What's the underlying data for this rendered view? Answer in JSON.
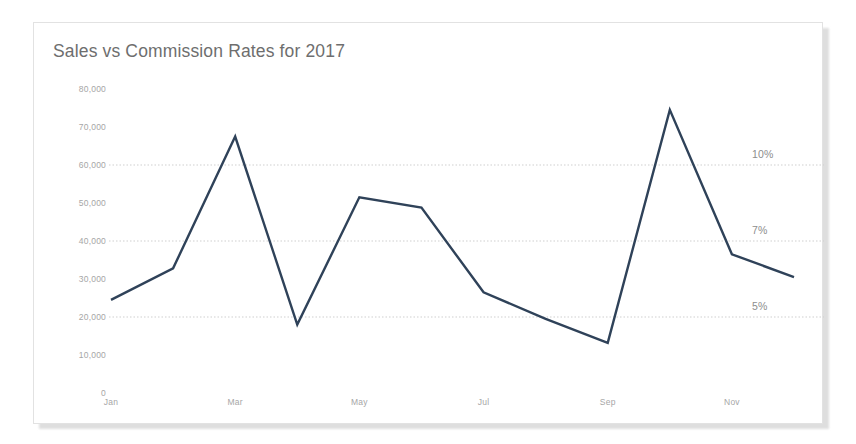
{
  "card": {
    "title": "Sales vs Commission Rates for 2017"
  },
  "colors": {
    "line": "#2f4259",
    "title_text": "#6e6e6e",
    "tick_text": "#a6a6a6",
    "pct_text": "#8d8d8d",
    "gridline": "#cfcfcf",
    "card_border": "#e2e2e2",
    "card_background": "#ffffff",
    "page_background": "#ffffff"
  },
  "chart_data": {
    "type": "line",
    "title": "Sales vs Commission Rates for 2017",
    "xlabel": "",
    "ylabel": "",
    "ylim": [
      0,
      80000
    ],
    "grid": true,
    "legend": "none",
    "x": [
      "Jan",
      "Feb",
      "Mar",
      "Apr",
      "May",
      "Jun",
      "Jul",
      "Aug",
      "Sep",
      "Oct",
      "Nov",
      "Dec"
    ],
    "categories": [
      "Jan",
      "Feb",
      "Mar",
      "Apr",
      "May",
      "Jun",
      "Jul",
      "Aug",
      "Sep",
      "Oct",
      "Nov",
      "Dec"
    ],
    "xtick_labels": [
      "Jan",
      "Mar",
      "May",
      "Jul",
      "Sep",
      "Nov"
    ],
    "ytick_labels": [
      "80,000",
      "70,000",
      "60,000",
      "50,000",
      "40,000",
      "30,000",
      "20,000",
      "10,000",
      "0"
    ],
    "ytick_values": [
      80000,
      70000,
      60000,
      50000,
      40000,
      30000,
      20000,
      10000,
      0
    ],
    "series": [
      {
        "name": "Sales",
        "values": [
          24500,
          32800,
          67500,
          18000,
          51500,
          48800,
          26500,
          19500,
          13200,
          74500,
          36500,
          30500
        ]
      }
    ],
    "reference_lines": [
      {
        "label": "10%",
        "value": 60000
      },
      {
        "label": "7%",
        "value": 40000
      },
      {
        "label": "5%",
        "value": 20000
      }
    ]
  }
}
